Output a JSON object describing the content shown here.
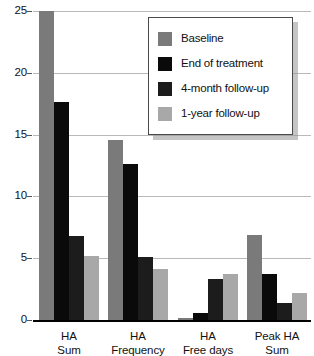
{
  "chart_data": {
    "type": "bar",
    "title": "",
    "xlabel": "",
    "ylabel": "",
    "ylim": [
      0,
      25
    ],
    "yticks": [
      0,
      5,
      10,
      15,
      20,
      25
    ],
    "grid": true,
    "legend_position": "top-center",
    "categories": [
      "HA Sum",
      "HA Frequency",
      "HA Free days",
      "Peak HA Sum"
    ],
    "category_lines": [
      [
        "HA",
        "Sum"
      ],
      [
        "HA",
        "Frequency"
      ],
      [
        "HA",
        "Free days"
      ],
      [
        "Peak HA",
        "Sum"
      ]
    ],
    "series": [
      {
        "name": "Baseline",
        "color": "#7a7a7a",
        "values": [
          25.0,
          14.6,
          0.2,
          6.9
        ]
      },
      {
        "name": "End of treatment",
        "color": "#0a0a0a",
        "values": [
          17.6,
          12.6,
          0.6,
          3.7
        ]
      },
      {
        "name": "4-month follow-up",
        "color": "#1c1c1c",
        "values": [
          6.8,
          5.1,
          3.3,
          1.4
        ]
      },
      {
        "name": "1-year follow-up",
        "color": "#a8a8a8",
        "values": [
          5.2,
          4.1,
          3.7,
          2.2
        ]
      }
    ]
  },
  "legend": {
    "items": [
      {
        "label": "Baseline",
        "color": "#7a7a7a"
      },
      {
        "label": "End of treatment",
        "color": "#0a0a0a"
      },
      {
        "label": "4-month follow-up",
        "color": "#1c1c1c"
      },
      {
        "label": "1-year follow-up",
        "color": "#a8a8a8"
      }
    ]
  },
  "axis": {
    "y_tick_labels": [
      "25",
      "20",
      "15",
      "10",
      "5",
      "0"
    ]
  }
}
